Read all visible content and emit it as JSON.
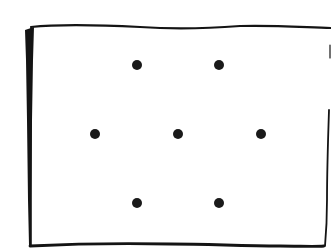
{
  "diagram": {
    "frame": {
      "left": 26,
      "top": 24,
      "right": 325,
      "bottom": 247,
      "stroke_color": "#141414"
    },
    "dots": [
      {
        "x": 137,
        "y": 65,
        "r": 5
      },
      {
        "x": 219,
        "y": 65,
        "r": 5
      },
      {
        "x": 95,
        "y": 134,
        "r": 5
      },
      {
        "x": 178,
        "y": 134,
        "r": 5
      },
      {
        "x": 261,
        "y": 134,
        "r": 5
      },
      {
        "x": 137,
        "y": 203,
        "r": 5
      },
      {
        "x": 219,
        "y": 203,
        "r": 5
      }
    ],
    "dot_color": "#1a1a1a",
    "dot_count": 7
  }
}
